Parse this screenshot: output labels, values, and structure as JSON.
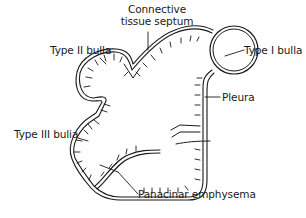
{
  "diagram": {
    "stroke_color": "#1a1a1a",
    "background": "#ffffff",
    "labels": {
      "connective_tissue_septum_line1": "Connective",
      "connective_tissue_septum_line2": "tissue septum",
      "type_ii_bulla": "Type II bulla",
      "type_i_bulla": "Type I bulla",
      "pleura": "Pleura",
      "type_iii_bulla": "Type III bulia",
      "panacinar_emphysema": "Panacinar emphysema"
    },
    "structures": [
      {
        "id": "type-i-bulla",
        "shape": "circle",
        "label": "Type I bulla"
      },
      {
        "id": "type-ii-bulla",
        "shape": "arc",
        "label": "Type II bulla"
      },
      {
        "id": "type-iii-bulla",
        "shape": "notch",
        "label": "Type III bulia"
      },
      {
        "id": "connective-tissue-septum",
        "shape": "dip",
        "label": "Connective tissue septum"
      },
      {
        "id": "pleura",
        "shape": "double-wall",
        "label": "Pleura"
      },
      {
        "id": "panacinar-emphysema",
        "shape": "interior",
        "label": "Panacinar emphysema"
      }
    ]
  }
}
